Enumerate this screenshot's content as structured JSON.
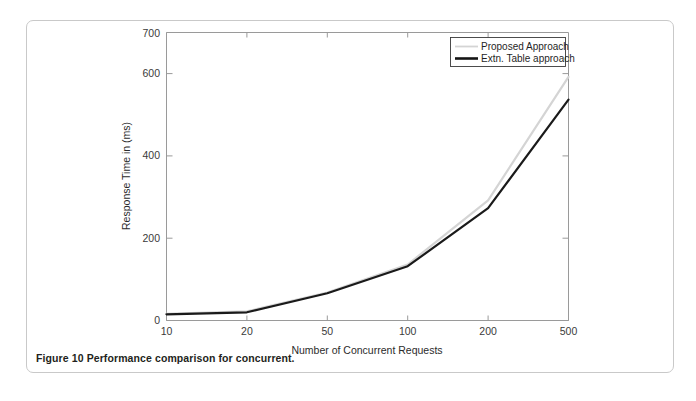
{
  "figure": {
    "caption_label": "Figure 10",
    "caption_text": "Performance comparison for concurrent."
  },
  "chart_data": {
    "type": "line",
    "title": "",
    "xlabel": "Number of Concurrent Requests",
    "ylabel": "Response Time in (ms)",
    "categories": [
      "10",
      "20",
      "50",
      "100",
      "200",
      "500"
    ],
    "xtick_labels": [
      "10",
      "20",
      "50",
      "100",
      "200",
      "500"
    ],
    "ytick_labels": [
      "0",
      "200",
      "400",
      "600",
      "700"
    ],
    "ytick_values": [
      0,
      200,
      400,
      600,
      700
    ],
    "ylim": [
      0,
      700
    ],
    "grid": false,
    "legend_position": "top-right",
    "series": [
      {
        "name": "Proposed Approach",
        "color": "#d4d4d4",
        "values": [
          16,
          22,
          68,
          136,
          292,
          592
        ]
      },
      {
        "name": "Extn. Table approach",
        "color": "#141414",
        "values": [
          15,
          20,
          66,
          132,
          273,
          537
        ]
      }
    ]
  },
  "legend": {
    "items": [
      {
        "label": "Proposed Approach"
      },
      {
        "label": "Extn. Table approach"
      }
    ]
  }
}
